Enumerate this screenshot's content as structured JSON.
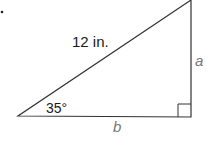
{
  "diagram": {
    "type": "right-triangle",
    "hypotenuse_label": "12 in.",
    "angle_label": "35°",
    "opposite_side_label": "a",
    "adjacent_side_label": "b",
    "right_angle_marker": true,
    "colors": {
      "stroke": "#333333",
      "text": "#1a1a1a",
      "variable_text": "#777777"
    }
  }
}
